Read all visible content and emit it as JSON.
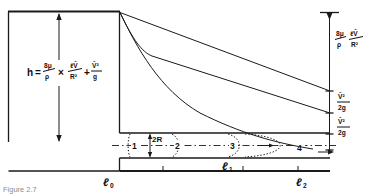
{
  "figure": {
    "caption": "Figure 2.7"
  },
  "equation": {
    "lhs": "h",
    "equals": "=",
    "term1_num": "8μ",
    "term1_den": "ρ",
    "times": "×",
    "term2_num": "ℓV̄",
    "term2_den": "R²",
    "plus": "+",
    "term3_num": "V̄²",
    "term3_den": "g",
    "full": "h = 8μ/ρ × ℓV̄/R² + V̄²/g"
  },
  "head_label": {
    "symbol": "h"
  },
  "right_annotations": [
    {
      "id": "friction-head",
      "num_left": "8μ",
      "den_left": "ρ",
      "num_right": "ℓV̄",
      "den_right": "R²",
      "full": "8μ/ρ · ℓV̄/R²"
    },
    {
      "id": "velocity-head-upper",
      "num": "V̄²",
      "den": "2g",
      "full": "V̄²/2g"
    },
    {
      "id": "velocity-head-lower",
      "num": "V̄²",
      "den": "2g",
      "full": "V̄²/2g"
    }
  ],
  "stations": [
    {
      "id": "station-1",
      "label": "1"
    },
    {
      "id": "station-2",
      "label": "2"
    },
    {
      "id": "station-3",
      "label": "3"
    },
    {
      "id": "station-4",
      "label": "4"
    }
  ],
  "diameter_label": {
    "text": "2R"
  },
  "length_labels": [
    {
      "id": "length-0",
      "symbol": "ℓ",
      "sub": "0",
      "full": "ℓ0"
    },
    {
      "id": "length-1",
      "symbol": "ℓ",
      "sub": "1",
      "full": "ℓ1"
    },
    {
      "id": "length-2",
      "symbol": "ℓ",
      "sub": "2",
      "full": "ℓ2"
    }
  ],
  "colors": {
    "ink": "#1a1a1a",
    "background": "#ffffff",
    "caption": "#8d8d8d"
  }
}
